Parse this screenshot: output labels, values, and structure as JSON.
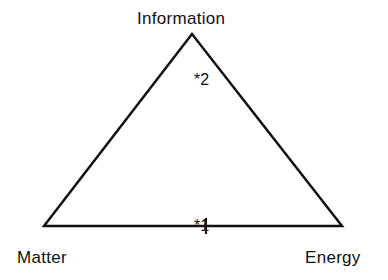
{
  "diagram": {
    "title": "",
    "vertices": [
      {
        "id": "top",
        "label": "Information",
        "x": 192,
        "y": 34
      },
      {
        "id": "bottom-left",
        "label": "Matter",
        "x": 44,
        "y": 226
      },
      {
        "id": "bottom-right",
        "label": "Energy",
        "x": 342,
        "y": 226
      }
    ],
    "markers": [
      {
        "id": "marker-2",
        "label": "*2",
        "location": "inside near top vertex"
      },
      {
        "id": "marker-1",
        "label": "*1",
        "location": "on base edge, midpoint"
      }
    ],
    "edges": [
      {
        "from": "bottom-left",
        "to": "top"
      },
      {
        "from": "top",
        "to": "bottom-right"
      },
      {
        "from": "bottom-left",
        "to": "bottom-right"
      }
    ],
    "colors": {
      "stroke": "#111111",
      "background": "#ffffff"
    }
  }
}
